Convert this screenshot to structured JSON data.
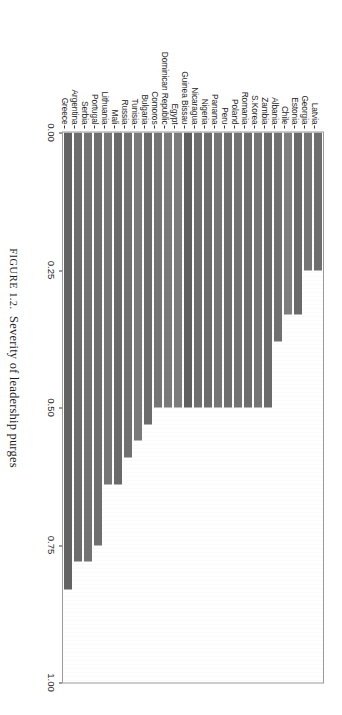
{
  "caption": {
    "figure_word": "FIGURE",
    "figure_number": "1.2.",
    "text": "Severity of leadership purges"
  },
  "chart_data": {
    "type": "bar",
    "orientation": "horizontal",
    "title": "",
    "xlabel": "",
    "ylabel": "",
    "xlim": [
      0.0,
      1.0
    ],
    "grid": false,
    "legend": "none",
    "tick_labels": [
      "0.00",
      "0.25",
      "0.50",
      "0.75",
      "1.00"
    ],
    "tick_values": [
      0.0,
      0.25,
      0.5,
      0.75,
      1.0
    ],
    "bar_color": "#6f6f6f",
    "categories": [
      "Latvia",
      "Georgia",
      "Estonia",
      "Chile",
      "Albania",
      "Zambia",
      "S.Korea",
      "Romania",
      "Poland",
      "Peru",
      "Panama",
      "Nigeria",
      "Nicaragua",
      "Guinea Bissau",
      "Egypt",
      "Dominican Republic",
      "Comoros",
      "Bulgaria",
      "Tunisia",
      "Russia",
      "Mali",
      "Lithuania",
      "Portugal",
      "Serbia",
      "Argentina",
      "Greece"
    ],
    "values": [
      0.25,
      0.25,
      0.33,
      0.33,
      0.38,
      0.5,
      0.5,
      0.5,
      0.5,
      0.5,
      0.5,
      0.5,
      0.5,
      0.5,
      0.5,
      0.5,
      0.5,
      0.53,
      0.56,
      0.59,
      0.64,
      0.64,
      0.75,
      0.78,
      0.78,
      0.83
    ],
    "bar_shades": [
      "#6e6e6e",
      "#757575",
      "#6a6a6a",
      "#7e7e7e",
      "#717171",
      "#6b6b6b",
      "#757575",
      "#6d6d6d",
      "#737373",
      "#6e6e6e",
      "#767676",
      "#6c6c6c",
      "#6f6f6f",
      "#5f5f5f",
      "#7c7c7c",
      "#7a7a7a",
      "#757575",
      "#6c6c6c",
      "#7b7b7b",
      "#717171",
      "#6a6a6a",
      "#767676",
      "#6f6f6f",
      "#737373",
      "#6d6d6d",
      "#636363"
    ]
  }
}
